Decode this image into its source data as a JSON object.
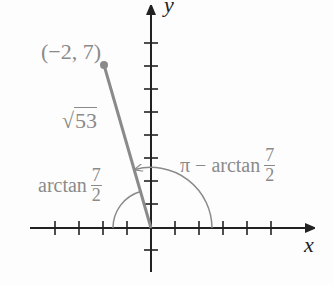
{
  "diagram": {
    "type": "coordinate-plane-angle",
    "point": {
      "label": "(−2, 7)",
      "x": -2,
      "y": 7
    },
    "segment_label": {
      "radical": "√",
      "radicand": "53"
    },
    "angle_left": {
      "prefix": "arctan",
      "num": "7",
      "den": "2"
    },
    "angle_right": {
      "prefix": "π − arctan",
      "num": "7",
      "den": "2"
    },
    "axes": {
      "x_label": "x",
      "y_label": "y"
    },
    "colors": {
      "axis": "#222222",
      "figure": "#8a8a8a",
      "background": "#fdfdfd"
    }
  }
}
